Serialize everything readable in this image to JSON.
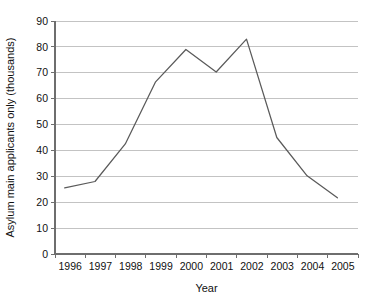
{
  "chart_data": {
    "type": "line",
    "title": "",
    "xlabel": "Year",
    "ylabel": "Asylum main applicants only (thousands)",
    "categories": [
      "1996",
      "1997",
      "1998",
      "1999",
      "2000",
      "2001",
      "2002",
      "2003",
      "2004",
      "2005"
    ],
    "x": [
      1996,
      1997,
      1998,
      1999,
      2000,
      2001,
      2002,
      2003,
      2004,
      2005
    ],
    "series": [
      {
        "name": "Asylum main applicants",
        "values": [
          25.5,
          28.0,
          42.5,
          66.5,
          79.0,
          70.3,
          83.0,
          45.0,
          30.2,
          21.7
        ]
      }
    ],
    "ylim": [
      0,
      90
    ],
    "yticks": [
      0,
      10,
      20,
      30,
      40,
      50,
      60,
      70,
      80,
      90
    ],
    "ytick_labels": [
      "0",
      "10",
      "20",
      "30",
      "40",
      "50",
      "60",
      "70",
      "80",
      "90"
    ],
    "xtick_labels": [
      "1996",
      "1997",
      "1998",
      "1999",
      "2000",
      "2001",
      "2002",
      "2003",
      "2004",
      "2005"
    ],
    "grid": true,
    "grid_axis": "y",
    "legend": false,
    "legend_position": "none",
    "line_color": "#5a5a5a",
    "grid_color": "#b4b4b4",
    "axis_color": "#6e6e6e",
    "background": "#ffffff"
  }
}
